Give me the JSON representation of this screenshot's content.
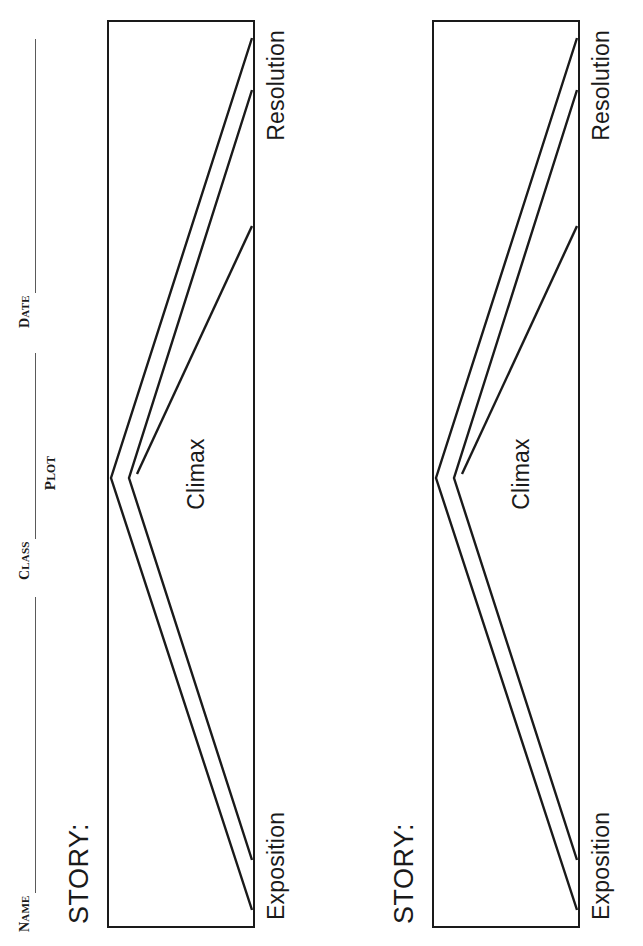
{
  "worksheet": {
    "header": {
      "name_label": "Name",
      "class_label": "Class",
      "date_label": "Date",
      "name_value": "",
      "class_value": "",
      "date_value": ""
    },
    "title": "Plot",
    "sections": [
      {
        "story_label": "STORY:",
        "diagram": {
          "exposition_label": "Exposition",
          "climax_label": "Climax",
          "resolution_label": "Resolution"
        }
      },
      {
        "story_label": "STORY:",
        "diagram": {
          "exposition_label": "Exposition",
          "climax_label": "Climax",
          "resolution_label": "Resolution"
        }
      }
    ],
    "colors": {
      "ink": "#1a1a1a",
      "rule": "#5a5a5a",
      "paper": "#ffffff"
    }
  }
}
